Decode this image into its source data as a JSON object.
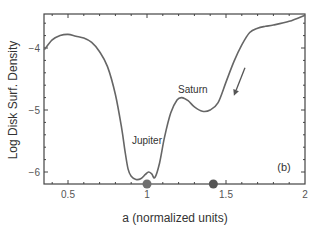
{
  "chart_data": {
    "type": "line",
    "title": "",
    "xlabel": "a (normalized units)",
    "ylabel": "Log Disk Surf. Density",
    "xlim": [
      0.35,
      2.0
    ],
    "ylim": [
      -6.18,
      -3.45
    ],
    "xticks": [
      0.5,
      1,
      1.5,
      2
    ],
    "xtick_labels": [
      "0.5",
      "1",
      "1.5",
      "2"
    ],
    "yticks": [
      -4,
      -5,
      -6
    ],
    "ytick_labels": [
      "-4",
      "-5",
      "-6"
    ],
    "grid": false,
    "legend": null,
    "panel_label": "(b)",
    "series": [
      {
        "name": "surface density",
        "x": [
          0.35,
          0.4,
          0.45,
          0.5,
          0.55,
          0.6,
          0.65,
          0.7,
          0.75,
          0.8,
          0.84,
          0.86,
          0.88,
          0.9,
          0.93,
          0.96,
          0.99,
          1.01,
          1.03,
          1.05,
          1.08,
          1.11,
          1.15,
          1.19,
          1.22,
          1.26,
          1.3,
          1.35,
          1.4,
          1.45,
          1.5,
          1.55,
          1.6,
          1.65,
          1.7,
          1.75,
          1.8,
          1.9,
          2.0
        ],
        "y": [
          -4.03,
          -3.87,
          -3.8,
          -3.78,
          -3.81,
          -3.84,
          -3.91,
          -4.06,
          -4.3,
          -4.75,
          -5.3,
          -5.65,
          -5.95,
          -6.07,
          -6.12,
          -6.11,
          -6.04,
          -6.0,
          -6.03,
          -6.09,
          -5.85,
          -5.45,
          -5.05,
          -4.84,
          -4.8,
          -4.85,
          -4.95,
          -5.02,
          -5.0,
          -4.88,
          -4.55,
          -4.22,
          -3.95,
          -3.75,
          -3.68,
          -3.65,
          -3.63,
          -3.57,
          -3.47
        ]
      }
    ],
    "markers": [
      {
        "label": "Jupiter",
        "x": 1.0,
        "y": -6.18,
        "color": "#707070"
      },
      {
        "label": "Saturn",
        "x": 1.42,
        "y": -6.18,
        "color": "#555555"
      }
    ],
    "annotations": [
      {
        "text": "Jupiter",
        "x": 1.0,
        "y": -5.55
      },
      {
        "text": "Saturn",
        "x": 1.29,
        "y": -4.72
      },
      {
        "text": "arrow",
        "from": [
          1.62,
          -4.32
        ],
        "to": [
          1.55,
          -4.77
        ]
      }
    ]
  },
  "colors": {
    "line": "#666666",
    "axis": "#444444",
    "jupiter_dot": "#707070",
    "saturn_dot": "#555555"
  }
}
